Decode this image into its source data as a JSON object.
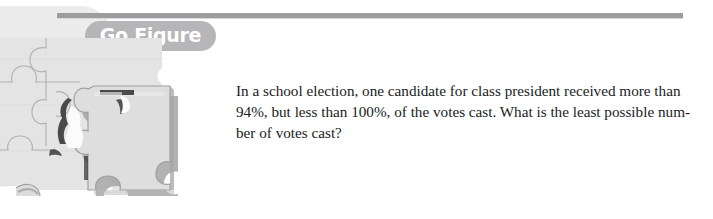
{
  "page": {
    "background_color": "#ffffff",
    "width": 713,
    "height": 219
  },
  "header": {
    "rule_color": "#9d9d9f",
    "banner": {
      "label": "Go Figure",
      "pill_color": "#b6b6b8",
      "text_color": "#ffffff"
    }
  },
  "illustration": {
    "name": "jigsaw-puzzle",
    "description": "Grayscale jigsaw puzzle with one raised piece casting a shadow",
    "piece_fill": "#dcdcdc",
    "piece_fill_light": "#e8e8e8",
    "outline_color": "#a8a8a8",
    "shadow_color": "#9a9a9a",
    "dark_gap_color": "#3a3a3a"
  },
  "problem": {
    "text": "In a school election, one candidate for class president received more than 94%, but less than 100%, of the votes cast. What is the least possible number of votes cast?",
    "lines": [
      "In a school election, one candidate for class president received more than",
      "94%, but less than 100%, of the votes cast. What is the least possible num-",
      "ber of votes cast?"
    ],
    "text_color": "#1b1b1b"
  }
}
